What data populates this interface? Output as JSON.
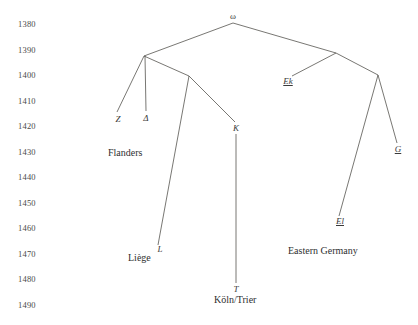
{
  "figure": {
    "kind": "manuscript-stemma",
    "background_color": "#ffffff",
    "line_color": "#55544f",
    "text_color": "#3a3a3a",
    "width": 418,
    "height": 325
  },
  "axis": {
    "name": "year-axis",
    "orientation": "vertical",
    "ticks": [
      {
        "label": "1380",
        "x": 18,
        "y": 25
      },
      {
        "label": "1390",
        "x": 18,
        "y": 51
      },
      {
        "label": "1400",
        "x": 18,
        "y": 76
      },
      {
        "label": "1410",
        "x": 18,
        "y": 102
      },
      {
        "label": "1420",
        "x": 18,
        "y": 127
      },
      {
        "label": "1430",
        "x": 18,
        "y": 153
      },
      {
        "label": "1440",
        "x": 18,
        "y": 178
      },
      {
        "label": "1450",
        "x": 18,
        "y": 204
      },
      {
        "label": "1460",
        "x": 18,
        "y": 229
      },
      {
        "label": "1470",
        "x": 18,
        "y": 255
      },
      {
        "label": "1480",
        "x": 18,
        "y": 280
      },
      {
        "label": "1490",
        "x": 18,
        "y": 306
      }
    ]
  },
  "nodes": [
    {
      "id": "omega",
      "label": "ω",
      "x": 233,
      "y": 17,
      "style": "greek",
      "anchor": "center"
    },
    {
      "id": "Z",
      "label": "Z",
      "x": 118,
      "y": 120,
      "style": "italic",
      "anchor": "center"
    },
    {
      "id": "Delta",
      "label": "Δ",
      "x": 146,
      "y": 119,
      "style": "italic",
      "anchor": "center"
    },
    {
      "id": "K",
      "label": "K",
      "x": 236,
      "y": 129,
      "style": "italic",
      "anchor": "center"
    },
    {
      "id": "L",
      "label": "L",
      "x": 160,
      "y": 250,
      "style": "italic",
      "anchor": "center"
    },
    {
      "id": "T",
      "label": "T",
      "x": 236,
      "y": 290,
      "style": "italic",
      "anchor": "center"
    },
    {
      "id": "Ek",
      "label": "Ek",
      "x": 288,
      "y": 82,
      "style": "underlined",
      "anchor": "center"
    },
    {
      "id": "G",
      "label": "G",
      "x": 398,
      "y": 150,
      "style": "underlined",
      "anchor": "center"
    },
    {
      "id": "El",
      "label": "El",
      "x": 340,
      "y": 222,
      "style": "underlined",
      "anchor": "center"
    }
  ],
  "junctions": [
    {
      "id": "j-omega",
      "x": 233,
      "y": 23
    },
    {
      "id": "j-left",
      "x": 144,
      "y": 56
    },
    {
      "id": "j-mid",
      "x": 189,
      "y": 76
    },
    {
      "id": "j-right",
      "x": 336,
      "y": 53
    },
    {
      "id": "j-german",
      "x": 378,
      "y": 75
    }
  ],
  "edges": [
    {
      "id": "edge-omega-left",
      "from": "j-omega",
      "to": "j-left",
      "x1": 233,
      "y1": 23,
      "x2": 144,
      "y2": 56
    },
    {
      "id": "edge-omega-right",
      "from": "j-omega",
      "to": "j-right",
      "x1": 233,
      "y1": 23,
      "x2": 336,
      "y2": 53
    },
    {
      "id": "edge-left-Z",
      "from": "j-left",
      "to": "Z",
      "x1": 144,
      "y1": 56,
      "x2": 117,
      "y2": 112
    },
    {
      "id": "edge-left-Delta",
      "from": "j-left",
      "to": "Delta",
      "x1": 145,
      "y1": 56,
      "x2": 146,
      "y2": 111
    },
    {
      "id": "edge-left-mid",
      "from": "j-left",
      "to": "j-mid",
      "x1": 144,
      "y1": 56,
      "x2": 189,
      "y2": 76
    },
    {
      "id": "edge-mid-L",
      "from": "j-mid",
      "to": "L",
      "x1": 189,
      "y1": 76,
      "x2": 158,
      "y2": 245
    },
    {
      "id": "edge-mid-K",
      "from": "j-mid",
      "to": "K",
      "x1": 189,
      "y1": 76,
      "x2": 235,
      "y2": 122
    },
    {
      "id": "edge-K-T",
      "from": "K",
      "to": "T",
      "x1": 236,
      "y1": 134,
      "x2": 236,
      "y2": 283
    },
    {
      "id": "edge-right-Ek",
      "from": "j-right",
      "to": "Ek",
      "x1": 336,
      "y1": 53,
      "x2": 292,
      "y2": 76
    },
    {
      "id": "edge-right-german",
      "from": "j-right",
      "to": "j-german",
      "x1": 336,
      "y1": 53,
      "x2": 378,
      "y2": 75
    },
    {
      "id": "edge-german-El",
      "from": "j-german",
      "to": "El",
      "x1": 378,
      "y1": 75,
      "x2": 339,
      "y2": 216
    },
    {
      "id": "edge-german-G",
      "from": "j-german",
      "to": "G",
      "x1": 378,
      "y1": 75,
      "x2": 397,
      "y2": 143
    }
  ],
  "region_labels": [
    {
      "id": "flanders",
      "label": "Flanders",
      "x": 108,
      "y": 154
    },
    {
      "id": "liege",
      "label": "Liège",
      "x": 128,
      "y": 259
    },
    {
      "id": "koln-trier",
      "label": "Köln/Trier",
      "x": 214,
      "y": 301
    },
    {
      "id": "eastern-germany",
      "label": "Eastern Germany",
      "x": 288,
      "y": 252
    }
  ]
}
